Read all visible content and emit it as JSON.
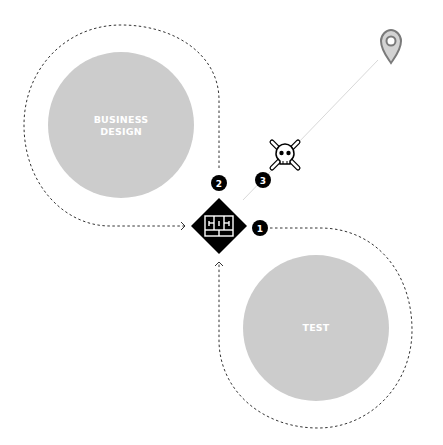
{
  "diagram": {
    "phases": [
      {
        "id": "business-design",
        "label_lines": [
          "BUSINESS",
          "DESIGN"
        ],
        "fill": "#cccccc"
      },
      {
        "id": "test",
        "label_lines": [
          "TEST"
        ],
        "fill": "#cccccc"
      }
    ],
    "center_node": {
      "icon": "grid-frame-icon",
      "fill": "#000000"
    },
    "badges": [
      {
        "number": "1"
      },
      {
        "number": "2"
      },
      {
        "number": "3"
      }
    ],
    "icons": {
      "risk": "skull-crossbones-icon",
      "destination": "map-pin-icon"
    },
    "colors": {
      "phase_fill": "#cccccc",
      "stroke": "#333333",
      "faint_line": "#d9d9d9",
      "pin": "#7a7a7a",
      "pin_fill": "#d3d3d3"
    }
  }
}
